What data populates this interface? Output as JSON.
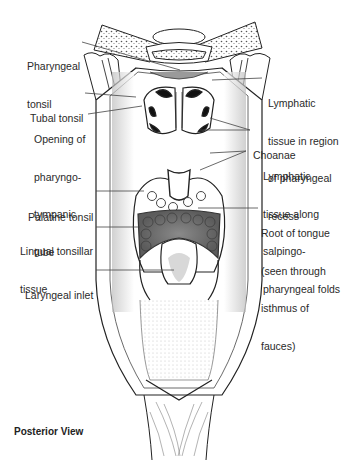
{
  "figure": {
    "view_caption": "Posterior View",
    "labels_left": [
      {
        "id": "pharyngeal-tonsil",
        "lines": [
          "Pharyngeal",
          "tonsil"
        ]
      },
      {
        "id": "tubal-tonsil",
        "lines": [
          "Tubal tonsil"
        ]
      },
      {
        "id": "opening-pharyngotympanic-tube",
        "lines": [
          "Opening of",
          "pharyngo-",
          "tympanic",
          "tube"
        ]
      },
      {
        "id": "palatine-tonsil",
        "lines": [
          "Palatine tonsil"
        ]
      },
      {
        "id": "lingual-tonsillar-tissue",
        "lines": [
          "Lingual tonsillar",
          "tissue"
        ]
      },
      {
        "id": "laryngeal-inlet",
        "lines": [
          "Laryngeal inlet"
        ]
      }
    ],
    "labels_right": [
      {
        "id": "lymphatic-pharyngeal-recess",
        "lines": [
          "Lymphatic",
          "tissue in region",
          "of pharyngeal",
          "recess"
        ]
      },
      {
        "id": "choanae",
        "lines": [
          "Choanae"
        ]
      },
      {
        "id": "lymphatic-salpingopharyngeal",
        "lines": [
          "Lymphatic",
          "tissue along",
          "salpingo-",
          "pharyngeal folds"
        ]
      },
      {
        "id": "root-of-tongue",
        "lines": [
          "Root of tongue",
          "(seen through",
          "isthmus of",
          "fauces)"
        ]
      }
    ]
  }
}
